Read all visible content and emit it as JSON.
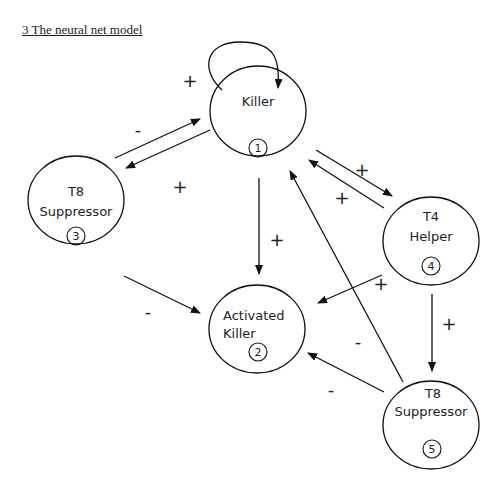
{
  "title": "3 The neural net model",
  "nodes": [
    {
      "id": 1,
      "label_lines": [
        "Killer"
      ],
      "number": "1"
    },
    {
      "id": 2,
      "label_lines": [
        "Activated",
        "Killer"
      ],
      "number": "2"
    },
    {
      "id": 3,
      "label_lines": [
        "T8",
        "Suppressor"
      ],
      "number": "3"
    },
    {
      "id": 4,
      "label_lines": [
        "T4",
        "Helper"
      ],
      "number": "4"
    },
    {
      "id": 5,
      "label_lines": [
        "T8",
        "Suppressor"
      ],
      "number": "5"
    }
  ],
  "edges": [
    {
      "from": 1,
      "to": 1,
      "sign": "+"
    },
    {
      "from": 3,
      "to": 1,
      "sign": "-"
    },
    {
      "from": 1,
      "to": 3,
      "sign": "+"
    },
    {
      "from": 1,
      "to": 4,
      "sign": "+"
    },
    {
      "from": 4,
      "to": 1,
      "sign": "+"
    },
    {
      "from": 1,
      "to": 2,
      "sign": "+"
    },
    {
      "from": 3,
      "to": 2,
      "sign": "-"
    },
    {
      "from": 4,
      "to": 2,
      "sign": "+"
    },
    {
      "from": 4,
      "to": 5,
      "sign": "+"
    },
    {
      "from": 5,
      "to": 1,
      "sign": "-"
    },
    {
      "from": 5,
      "to": 2,
      "sign": "-"
    }
  ],
  "signs": {
    "self_loop": "+",
    "e3_1": "-",
    "e1_3": "+",
    "e1_4": "+",
    "e4_1": "+",
    "e1_2": "+",
    "e3_2": "-",
    "e4_2": "+",
    "e4_5": "+",
    "e5_1": "-",
    "e5_2": "-"
  }
}
